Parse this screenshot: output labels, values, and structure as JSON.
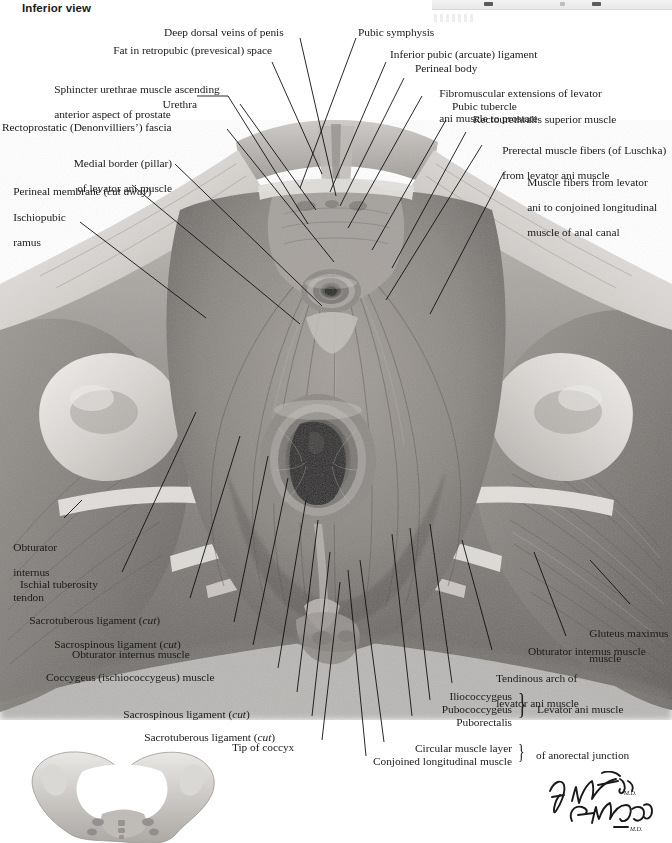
{
  "heading": {
    "view_label": "Inferior view"
  },
  "figure": {
    "type": "anatomical-illustration",
    "medium": "grayscale painted plate",
    "orientation_inset": "bony pelvis inferior aspect"
  },
  "labels_left": [
    {
      "id": "fat-retropubic",
      "text": "Fat in retropubic (prevesical) space"
    },
    {
      "id": "sphincter-urethrae",
      "line1": "Sphincter urethrae muscle ascending",
      "line2": "anterior aspect of prostate"
    },
    {
      "id": "urethra",
      "text": "Urethra"
    },
    {
      "id": "rectoprostatic",
      "text": "Rectoprostatic (Denonvilliers’) fascia"
    },
    {
      "id": "medial-border",
      "line1": "Medial border (pillar)",
      "line2": "of levator ani muscle"
    },
    {
      "id": "perineal-membrane",
      "pre": "Perineal membrane (",
      "em": "cut away",
      "post": ")"
    },
    {
      "id": "ischiopubic-ramus",
      "line1": "Ischiopubic",
      "line2": "ramus"
    }
  ],
  "labels_top": [
    {
      "id": "deep-dorsal-veins",
      "text": "Deep dorsal veins of penis"
    },
    {
      "id": "pubic-symphysis",
      "text": "Pubic symphysis"
    },
    {
      "id": "inferior-pubic-lig",
      "text": "Inferior pubic (arcuate) ligament"
    },
    {
      "id": "perineal-body",
      "text": "Perineal body"
    },
    {
      "id": "fibromuscular-ext",
      "line1": "Fibromuscular extensions of levator",
      "line2": "ani muscle to prostate"
    },
    {
      "id": "pubic-tubercle",
      "text": "Pubic tubercle"
    },
    {
      "id": "rectourethralis-sup",
      "text": "Rectourethralis superior muscle"
    },
    {
      "id": "prerectal-fibers",
      "line1": "Prerectal muscle fibers (of Luschka)",
      "line2": "from levator ani muscle"
    },
    {
      "id": "muscle-fibers-levator",
      "line1": "Muscle fibers from levator",
      "line2": "ani to conjoined longitudinal",
      "line3": "muscle of anal canal"
    }
  ],
  "labels_lower_left": [
    {
      "id": "obturator-internus-tendon",
      "line1": "Obturator",
      "line2": "internus",
      "line3": "tendon"
    },
    {
      "id": "ischial-tuberosity",
      "text": "Ischial tuberosity"
    },
    {
      "id": "sacrotuberous-lig-1",
      "pre": "Sacrotuberous ligament (",
      "em": "cut",
      "post": ")"
    },
    {
      "id": "sacrospinous-lig-1",
      "pre": "Sacrospinous ligament (",
      "em": "cut",
      "post": ")"
    },
    {
      "id": "obturator-internus-muscle",
      "text": "Obturator internus muscle"
    },
    {
      "id": "coccygeus-muscle",
      "text": "Coccygeus (ischiococcygeus) muscle"
    },
    {
      "id": "sacrospinous-lig-2",
      "pre": "Sacrospinous ligament (",
      "em": "cut",
      "post": ")"
    },
    {
      "id": "sacrotuberous-lig-2",
      "pre": "Sacrotuberous ligament (",
      "em": "cut",
      "post": ")"
    },
    {
      "id": "tip-of-coccyx",
      "text": "Tip of coccyx"
    }
  ],
  "labels_lower_right": [
    {
      "id": "gluteus-maximus",
      "line1": "Gluteus maximus",
      "line2": "muscle"
    },
    {
      "id": "obturator-internus-muscle-r",
      "text": "Obturator internus muscle"
    },
    {
      "id": "tendinous-arch",
      "line1": "Tendinous arch of",
      "line2": "levator ani muscle"
    }
  ],
  "brace_groups": [
    {
      "id": "levator-ani-group",
      "items": [
        "Iliococcygeus",
        "Pubococcygeus",
        "Puborectalis"
      ],
      "brace": "}",
      "caption": "Levator ani muscle"
    },
    {
      "id": "anorectal-junction-group",
      "items": [
        "Circular muscle layer",
        "Conjoined longitudinal muscle"
      ],
      "brace": "}",
      "caption": "of anorectal junction"
    }
  ],
  "signature": {
    "artist_primary": "F. Netter",
    "artist_primary_suffix": "M.D.",
    "artist_secondary": "C. Machado",
    "artist_secondary_suffix": "M.D."
  },
  "colors": {
    "ink": "#1b1b1b",
    "paper": "#ffffff",
    "leader": "#111111",
    "tissue_light": "#d9d6d2",
    "tissue_mid": "#a9a5a1",
    "tissue_dark": "#6f6c69",
    "tissue_deep": "#3c3a38"
  }
}
